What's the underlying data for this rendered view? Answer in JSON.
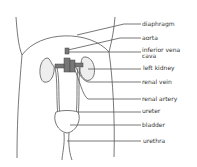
{
  "diagram": {
    "labels": [
      {
        "id": "diaphragm",
        "text": "diaphragm",
        "x": 142,
        "y": 21
      },
      {
        "id": "aorta",
        "text": "aorta",
        "x": 142,
        "y": 35
      },
      {
        "id": "inferior-vena-cava",
        "text": "inferior vena",
        "text2": "cava",
        "x": 142,
        "y": 47
      },
      {
        "id": "left-kidney",
        "text": "left kidney",
        "x": 143,
        "y": 65
      },
      {
        "id": "renal-vein",
        "text": "renal vein",
        "x": 142,
        "y": 79
      },
      {
        "id": "renal-artery",
        "text": "renal artery",
        "x": 142,
        "y": 96
      },
      {
        "id": "ureter",
        "text": "ureter",
        "x": 142,
        "y": 108
      },
      {
        "id": "bladder",
        "text": "bladder",
        "x": 142,
        "y": 122
      },
      {
        "id": "urethra",
        "text": "urethra",
        "x": 143,
        "y": 138
      }
    ],
    "colors": {
      "line": "#555555",
      "organ_fill": "#eeeeee",
      "vessel_fill": "#777777"
    }
  }
}
